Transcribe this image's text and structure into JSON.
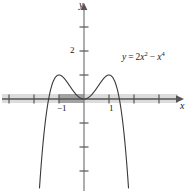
{
  "figure": {
    "kind": "cartesian-graph",
    "background_color": "#ffffff"
  },
  "axes": {
    "x_axis_label": "x",
    "y_axis_label": "y",
    "axis_color": "#555555",
    "origin_px": {
      "x": 84,
      "y": 99
    },
    "x_unit_px": 25,
    "y_unit_px": 24,
    "x_ticks": [
      -3,
      -2,
      -1,
      1,
      2,
      3
    ],
    "y_ticks": [
      1,
      2,
      3,
      -1,
      -2,
      -3
    ],
    "x_tick_labels": [
      {
        "value": -1,
        "text": "−1"
      },
      {
        "value": 1,
        "text": "1"
      }
    ],
    "y_tick_labels": [
      {
        "value": 2,
        "text": "2"
      }
    ],
    "grid": false
  },
  "curve": {
    "equation_text": "y = 2x² − x⁴",
    "equation_parts": {
      "lhs": "y",
      "equals": "=",
      "term1_coeff": "2",
      "term1_var": "x",
      "term1_exp": "2",
      "minus": "−",
      "term2_var": "x",
      "term2_exp": "4"
    },
    "color": "#3a3a3a",
    "stroke_width": 1.1,
    "maxima": [
      {
        "x": -1,
        "y": 2
      },
      {
        "x": 1,
        "y": 2
      }
    ],
    "minimum": {
      "x": 0,
      "y": 0
    },
    "roots": [
      -1.41421,
      0,
      1.41421
    ]
  },
  "chart_data": {
    "type": "line",
    "title": "",
    "xlabel": "x",
    "ylabel": "y",
    "xlim": [
      -3.55,
      3.95
    ],
    "ylim": [
      -3.9,
      4.05
    ],
    "grid": false,
    "legend": "none",
    "annotations": [
      {
        "text": "y = 2x² − x⁴",
        "x": 1.55,
        "y": 1.85
      }
    ],
    "series": [
      {
        "name": "y = 2x² − x⁴",
        "x": [
          -1.75,
          -1.7,
          -1.65,
          -1.6,
          -1.55,
          -1.5,
          -1.45,
          -1.4142,
          -1.4,
          -1.3,
          -1.2,
          -1.1,
          -1.0,
          -0.9,
          -0.8,
          -0.7,
          -0.6,
          -0.5,
          -0.4,
          -0.3,
          -0.2,
          -0.1,
          0.0,
          0.1,
          0.2,
          0.3,
          0.4,
          0.5,
          0.6,
          0.7,
          0.8,
          0.9,
          1.0,
          1.1,
          1.2,
          1.3,
          1.4,
          1.4142,
          1.45,
          1.5,
          1.55,
          1.6,
          1.65,
          1.7,
          1.75
        ],
        "y": [
          -3.26,
          -2.56,
          -1.96,
          -1.43,
          -0.97,
          -0.56,
          -0.22,
          0.0,
          0.08,
          0.52,
          0.81,
          0.95,
          1.0,
          0.96,
          0.87,
          0.74,
          0.59,
          0.44,
          0.29,
          0.17,
          0.078,
          0.0199,
          0.0,
          0.0199,
          0.078,
          0.17,
          0.29,
          0.44,
          0.59,
          0.74,
          0.87,
          0.96,
          1.0,
          0.95,
          0.81,
          0.52,
          0.08,
          0.0,
          -0.22,
          -0.56,
          -0.97,
          -1.43,
          -1.96,
          -2.56,
          -3.26
        ],
        "y_actual_note": "plotted values are 2x^2 - x^4"
      }
    ]
  },
  "highlight_band": {
    "description": "gray band along x-axis",
    "light_color": "#d9d9d9",
    "dark_color": "#9e9e9e",
    "light_from_x": -3.4,
    "light_to_x": 3.8,
    "dark_from_x": -1.0,
    "dark_to_x": 0.0
  }
}
